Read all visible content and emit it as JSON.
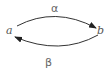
{
  "diagram": {
    "nodes": [
      {
        "id": "a",
        "label": "a"
      },
      {
        "id": "b",
        "label": "b"
      }
    ],
    "edges": [
      {
        "from": "a",
        "to": "b",
        "label": "α"
      },
      {
        "from": "b",
        "to": "a",
        "label": "β"
      }
    ],
    "colors": {
      "stroke": "#222222",
      "text": "#555555"
    }
  }
}
